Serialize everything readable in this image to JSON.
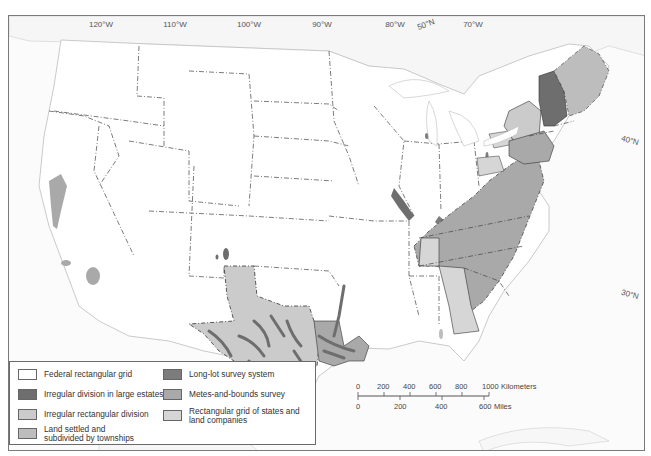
{
  "map": {
    "title": "Land survey systems of the conterminous United States",
    "longitude_labels": [
      {
        "label": "120°W",
        "x": 92
      },
      {
        "label": "110°W",
        "x": 166
      },
      {
        "label": "100°W",
        "x": 240
      },
      {
        "label": "90°W",
        "x": 313
      },
      {
        "label": "80°W",
        "x": 386
      },
      {
        "label": "70°W",
        "x": 464
      }
    ],
    "latitude_labels": [
      {
        "label": "50°N",
        "x": 416,
        "y": 23,
        "rotate": -20
      },
      {
        "label": "40°N",
        "x": 619,
        "y": 135,
        "rotate": 15
      },
      {
        "label": "30°N",
        "x": 619,
        "y": 289,
        "rotate": 15
      }
    ],
    "colors": {
      "federal_rectangular_grid": "#ffffff",
      "irregular_large_estates": "#6e6e6e",
      "irregular_rectangular": "#cbcbcb",
      "townships": "#bdbdbd",
      "long_lot": "#7c7c7c",
      "metes_and_bounds": "#a9a9a9",
      "rectangular_states_companies": "#d6d6d6",
      "boundary": "#333333",
      "coast": "#bfbfbf"
    }
  },
  "legend": {
    "items": [
      {
        "label": "Federal rectangular grid",
        "color": "#ffffff"
      },
      {
        "label": "Irregular division in large estates",
        "color": "#6e6e6e"
      },
      {
        "label": "Irregular rectangular division",
        "color": "#cbcbcb"
      },
      {
        "label": "Land settled and subdivided by townships",
        "color": "#bdbdbd"
      },
      {
        "label": "Long-lot survey system",
        "color": "#7c7c7c"
      },
      {
        "label": "Metes-and-bounds survey",
        "color": "#a9a9a9"
      },
      {
        "label": "Rectangular grid of states and land companies",
        "color": "#d6d6d6"
      }
    ]
  },
  "scale": {
    "km_ticks": [
      "0",
      "200",
      "400",
      "600",
      "800",
      "1000"
    ],
    "km_unit": "Kilometers",
    "mile_ticks": [
      "0",
      "200",
      "400",
      "600"
    ],
    "mile_unit": "Miles"
  }
}
